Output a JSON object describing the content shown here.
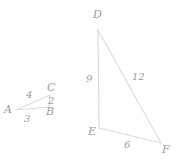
{
  "figure": {
    "stroke_color": "#dcdcdc",
    "text_color": "#9a9a9a",
    "background_color": "#ffffff",
    "stroke_width": 1.2
  },
  "triangle_small": {
    "name": "triangle-abc",
    "vertices": [
      {
        "label": "A",
        "x": 16,
        "y": 110,
        "label_x": 4,
        "label_y": 104
      },
      {
        "label": "B",
        "x": 49,
        "y": 107,
        "label_x": 46,
        "label_y": 106
      },
      {
        "label": "C",
        "x": 50,
        "y": 95,
        "label_x": 47,
        "label_y": 82
      }
    ],
    "edges": [
      {
        "from": "A",
        "to": "C",
        "label": "4",
        "label_x": 26,
        "label_y": 89
      },
      {
        "from": "C",
        "to": "B",
        "label": "2",
        "label_x": 48,
        "label_y": 95
      },
      {
        "from": "A",
        "to": "B",
        "label": "3",
        "label_x": 24,
        "label_y": 113
      }
    ]
  },
  "triangle_large": {
    "name": "triangle-def",
    "vertices": [
      {
        "label": "D",
        "x": 98,
        "y": 30,
        "label_x": 93,
        "label_y": 9
      },
      {
        "label": "E",
        "x": 99,
        "y": 128,
        "label_x": 88,
        "label_y": 126
      },
      {
        "label": "F",
        "x": 161,
        "y": 143,
        "label_x": 162,
        "label_y": 144
      }
    ],
    "edges": [
      {
        "from": "D",
        "to": "E",
        "label": "9",
        "label_x": 86,
        "label_y": 73
      },
      {
        "from": "D",
        "to": "F",
        "label": "12",
        "label_x": 132,
        "label_y": 71
      },
      {
        "from": "E",
        "to": "F",
        "label": "6",
        "label_x": 124,
        "label_y": 139
      }
    ]
  }
}
